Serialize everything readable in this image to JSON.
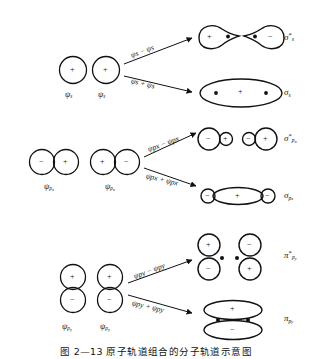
{
  "figure": {
    "caption": "图 2—13    原子轨道组合的分子轨道示意图",
    "rows": [
      {
        "id": "sigma-s",
        "inputs": [
          {
            "label_base": "ψ",
            "label_sub": "s",
            "signs": [
              "+"
            ]
          },
          {
            "label_base": "ψ",
            "label_sub": "s",
            "signs": [
              "+"
            ]
          }
        ],
        "equations": {
          "antibonding": "ψs − ψs",
          "bonding": "ψs + ψs"
        },
        "outputs": {
          "antibonding": {
            "base": "σ",
            "star": "*",
            "sub": "s",
            "signs": [
              "+",
              "−"
            ]
          },
          "bonding": {
            "base": "σ",
            "star": "",
            "sub": "s",
            "signs": [
              "+"
            ]
          }
        }
      },
      {
        "id": "sigma-px",
        "inputs": [
          {
            "label_base": "ψ",
            "label_sub": "p",
            "label_sub2": "x",
            "signs": [
              "−",
              "+"
            ]
          },
          {
            "label_base": "ψ",
            "label_sub": "p",
            "label_sub2": "x",
            "signs": [
              "+",
              "−"
            ]
          }
        ],
        "equations": {
          "antibonding": "ψpx − ψpx",
          "bonding": "ψpx + ψpx"
        },
        "outputs": {
          "antibonding": {
            "base": "σ",
            "star": "*",
            "sub": "p",
            "sub2": "x",
            "signs": [
              "−",
              "+",
              "−",
              "+"
            ]
          },
          "bonding": {
            "base": "σ",
            "star": "",
            "sub": "p",
            "sub2": "x",
            "signs": [
              "−",
              "+",
              "−"
            ]
          }
        }
      },
      {
        "id": "pi-py",
        "inputs": [
          {
            "label_base": "ψ",
            "label_sub": "p",
            "label_sub2": "y",
            "signs": [
              "+",
              "−"
            ]
          },
          {
            "label_base": "ψ",
            "label_sub": "p",
            "label_sub2": "y",
            "signs": [
              "+",
              "−"
            ]
          }
        ],
        "equations": {
          "antibonding": "ψpy − ψpy",
          "bonding": "ψpy + ψpy"
        },
        "outputs": {
          "antibonding": {
            "base": "π",
            "star": "*",
            "sub": "p",
            "sub2": "y",
            "signs": [
              "+",
              "−",
              "−",
              "+"
            ]
          },
          "bonding": {
            "base": "π",
            "star": "",
            "sub": "p",
            "sub2": "y",
            "signs": [
              "+",
              "−"
            ]
          }
        }
      }
    ]
  },
  "glyphs": {
    "psi": "ψ",
    "sigma": "σ",
    "pi": "π",
    "plus": "+",
    "minus": "−",
    "star": "*",
    "sub_s": "s",
    "sub_p": "p",
    "sub_x": "x",
    "sub_y": "y"
  },
  "colors": {
    "ink": "#111111",
    "background": "#ffffff"
  }
}
